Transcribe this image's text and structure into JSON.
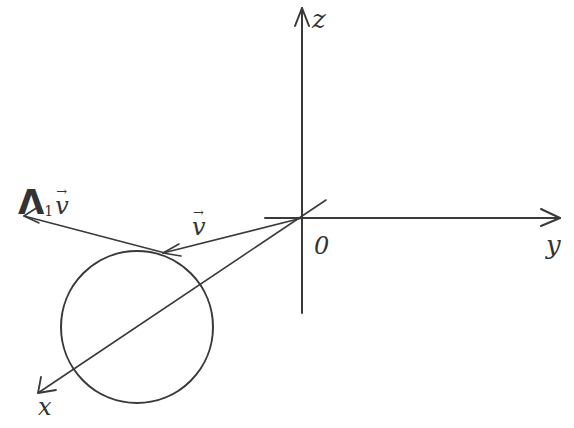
{
  "diagram": {
    "axes": {
      "z_label": "z",
      "y_label": "y",
      "x_label": "x",
      "origin_label": "0"
    },
    "vectors": {
      "v": {
        "symbol": "v",
        "arrow": "→"
      },
      "lambda_v": {
        "lambda": "Λ",
        "subscript": "1",
        "symbol": "v",
        "arrow": "→"
      }
    },
    "circle": {
      "cx": 137,
      "cy": 327,
      "r": 76
    },
    "colors": {
      "ink": "#3a3a3a",
      "background": "#ffffff"
    }
  }
}
